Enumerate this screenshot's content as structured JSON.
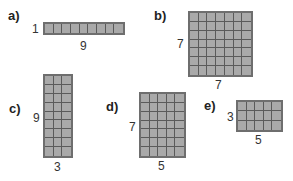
{
  "figures": [
    {
      "id": "a",
      "label": "a)",
      "rows": 1,
      "cols": 9,
      "height_label": "1",
      "width_label": "9",
      "grid": {
        "x": 43,
        "y": 22,
        "w": 82,
        "h": 13
      },
      "label_pos": {
        "x": 8,
        "y": 9
      },
      "height_pos": {
        "x": 32,
        "y": 23
      },
      "width_pos": {
        "x": 80,
        "y": 40
      }
    },
    {
      "id": "b",
      "label": "b)",
      "rows": 7,
      "cols": 7,
      "height_label": "7",
      "width_label": "7",
      "grid": {
        "x": 188,
        "y": 11,
        "w": 65,
        "h": 66
      },
      "label_pos": {
        "x": 154,
        "y": 9
      },
      "height_pos": {
        "x": 177,
        "y": 38
      },
      "width_pos": {
        "x": 215,
        "y": 79
      }
    },
    {
      "id": "c",
      "label": "c)",
      "rows": 9,
      "cols": 3,
      "height_label": "9",
      "width_label": "3",
      "grid": {
        "x": 43,
        "y": 74,
        "w": 30,
        "h": 84
      },
      "label_pos": {
        "x": 9,
        "y": 102
      },
      "height_pos": {
        "x": 33,
        "y": 112
      },
      "width_pos": {
        "x": 54,
        "y": 161
      }
    },
    {
      "id": "d",
      "label": "d)",
      "rows": 7,
      "cols": 5,
      "height_label": "7",
      "width_label": "5",
      "grid": {
        "x": 139,
        "y": 92,
        "w": 47,
        "h": 66
      },
      "label_pos": {
        "x": 106,
        "y": 100
      },
      "height_pos": {
        "x": 129,
        "y": 121
      },
      "width_pos": {
        "x": 158,
        "y": 160
      }
    },
    {
      "id": "e",
      "label": "e)",
      "rows": 3,
      "cols": 5,
      "height_label": "3",
      "width_label": "5",
      "grid": {
        "x": 236,
        "y": 100,
        "w": 47,
        "h": 32
      },
      "label_pos": {
        "x": 204,
        "y": 99
      },
      "height_pos": {
        "x": 227,
        "y": 111
      },
      "width_pos": {
        "x": 255,
        "y": 134
      }
    }
  ],
  "colors": {
    "fill": "#a9a9a9",
    "grid_line": "#5a5a5a",
    "border": "#6e6e6e"
  }
}
